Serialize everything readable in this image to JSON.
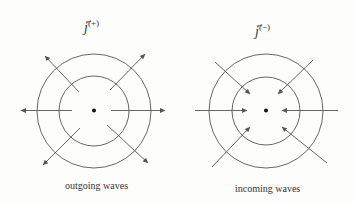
{
  "figures": [
    {
      "id": "outgoing",
      "title_symbol": "j",
      "title_superscript": "(+)",
      "caption": "outgoing waves",
      "direction": "outward",
      "center": [
        94,
        111
      ],
      "outer_radius": 57,
      "inner_radius": 35,
      "arrow_count": 8
    },
    {
      "id": "incoming",
      "title_symbol": "j",
      "title_superscript": "(−)",
      "caption": "incoming waves",
      "direction": "inward",
      "center": [
        266,
        111
      ],
      "outer_radius": 57,
      "inner_radius": 34,
      "arrow_count": 8
    }
  ],
  "colors": {
    "stroke": "#555555",
    "dot": "#111111",
    "background": "#fdfdfc"
  }
}
